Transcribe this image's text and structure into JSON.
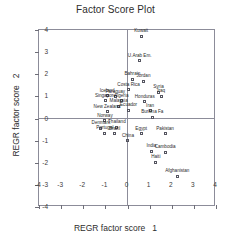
{
  "chart_data": {
    "type": "scatter",
    "title": "Factor Score Plot",
    "xlabel": "REGR factor score   1",
    "ylabel": "REGR factor score   2",
    "xlim": [
      -4,
      4
    ],
    "ylim": [
      -4,
      4
    ],
    "xticks": [
      "-4",
      "-3",
      "-2",
      "-1",
      "0",
      "1",
      "2",
      "3",
      "4"
    ],
    "yticks": [
      "4",
      "3",
      "2",
      "1",
      "0",
      "-1",
      "-2",
      "-3",
      "-4"
    ],
    "xtick_values": [
      -4,
      -3,
      -2,
      -1,
      0,
      1,
      2,
      3,
      4
    ],
    "ytick_values": [
      4,
      3,
      2,
      1,
      0,
      -1,
      -2,
      -3,
      -4
    ],
    "grid": false,
    "legend": "none",
    "marker": "open-square",
    "points": [
      {
        "label": "Kuwait",
        "x": 0.62,
        "y": 3.72
      },
      {
        "label": "U.Arab Em.",
        "x": 0.55,
        "y": 2.62
      },
      {
        "label": "Bahrain",
        "x": 0.22,
        "y": 1.78
      },
      {
        "label": "Jordan",
        "x": 0.72,
        "y": 1.68
      },
      {
        "label": "Costa Rica",
        "x": 0.05,
        "y": 1.3
      },
      {
        "label": "Syria",
        "x": 1.4,
        "y": 1.18
      },
      {
        "label": "Iceland",
        "x": -0.92,
        "y": 1.02
      },
      {
        "label": "Paraguay",
        "x": -0.55,
        "y": 0.98
      },
      {
        "label": "Iraq",
        "x": 1.52,
        "y": 1.0
      },
      {
        "label": "Singapore",
        "x": -1.0,
        "y": 0.8
      },
      {
        "label": "Algeria",
        "x": -0.28,
        "y": 0.8
      },
      {
        "label": "Honduras",
        "x": 0.78,
        "y": 0.76
      },
      {
        "label": "Malaysia",
        "x": -0.4,
        "y": 0.55
      },
      {
        "label": "Ecuador",
        "x": 0.05,
        "y": 0.38
      },
      {
        "label": "Iran",
        "x": 1.02,
        "y": 0.35
      },
      {
        "label": "New Zealand",
        "x": -0.92,
        "y": 0.3
      },
      {
        "label": "Burkina Fa",
        "x": 1.12,
        "y": 0.06
      },
      {
        "label": "Norway",
        "x": -1.02,
        "y": -0.1
      },
      {
        "label": "Thailand",
        "x": -0.48,
        "y": -0.4
      },
      {
        "label": "Denmark",
        "x": -1.2,
        "y": -0.44
      },
      {
        "label": "Portugal",
        "x": -1.02,
        "y": -0.66
      },
      {
        "label": "Brazil",
        "x": -0.58,
        "y": -0.68
      },
      {
        "label": "Egypt",
        "x": 0.62,
        "y": -0.7
      },
      {
        "label": "Pakistan",
        "x": 1.7,
        "y": -0.7
      },
      {
        "label": "China",
        "x": 0.02,
        "y": -1.0
      },
      {
        "label": "India",
        "x": 1.08,
        "y": -1.48
      },
      {
        "label": "Cambodia",
        "x": 1.7,
        "y": -1.52
      },
      {
        "label": "Haiti",
        "x": 1.28,
        "y": -1.98
      },
      {
        "label": "Afghanistan",
        "x": 2.25,
        "y": -2.62
      }
    ]
  }
}
